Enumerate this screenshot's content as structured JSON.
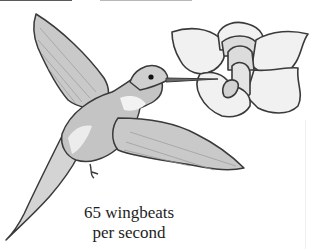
{
  "figure": {
    "type": "illustration",
    "caption": {
      "line1": "65 wingbeats",
      "line2": "per second"
    },
    "colors": {
      "outline": "#3a3a3a",
      "bird_fill": "#c9c9c9",
      "bird_highlight": "#f2f2f2",
      "flower_fill": "#f1f1f1",
      "flower_inner": "#dcdcdc",
      "caption_text": "#1e1e1e",
      "background": "#ffffff"
    }
  }
}
